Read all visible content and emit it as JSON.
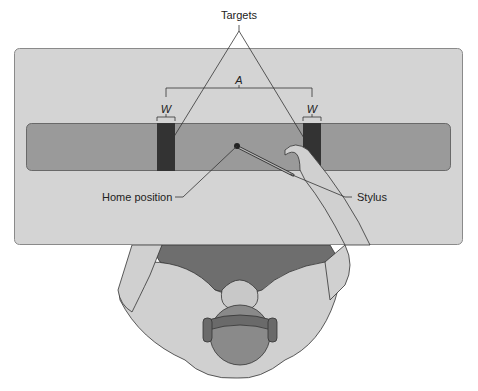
{
  "figure": {
    "labels": {
      "targets": "Targets",
      "amplitude": "A",
      "width_left": "W",
      "width_right": "W",
      "home_position": "Home position",
      "stylus": "Stylus"
    },
    "colors": {
      "board": "#d4d4d4",
      "board_border": "#8a8a8a",
      "track": "#9a9a9a",
      "target": "#333333",
      "skin": "#d0d0d0",
      "shirt": "#6e6e6e",
      "hair": "#8a8a8a",
      "headset": "#6a6a6a",
      "line": "#333333"
    }
  }
}
